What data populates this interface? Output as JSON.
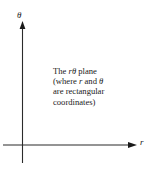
{
  "figure": {
    "background_color": "#ffffff",
    "ink_color": "#1a1a1a"
  },
  "axes": {
    "vertical": {
      "label": "θ",
      "icon": "up-arrow-axis",
      "direction": "up"
    },
    "horizontal": {
      "label": "r",
      "icon": "right-arrow-axis",
      "direction": "right"
    },
    "origin": {
      "x": 22,
      "y": 145
    }
  },
  "caption": {
    "line1_prefix": "The ",
    "line1_var1": "r",
    "line1_var2": "θ",
    "line1_suffix": " plane",
    "line2_prefix": "(where ",
    "line2_var1": "r",
    "line2_mid": " and ",
    "line2_var2": "θ",
    "line3": "are rectangular",
    "line4": "coordinates)",
    "full_text": "The rθ plane (where r and θ are rectangular coordinates)"
  }
}
